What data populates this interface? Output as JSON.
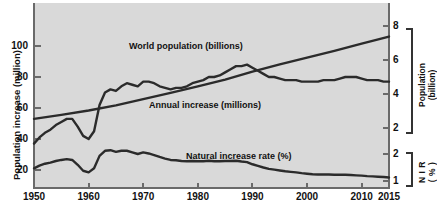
{
  "chart_data": {
    "type": "line",
    "title": "",
    "xlabel": "",
    "ylabel": "Population increase (million)",
    "xlim": [
      1950,
      2015
    ],
    "ylim": [
      0,
      110
    ],
    "grid": false,
    "legend": "inline-annotations",
    "x_ticks": [
      "1950",
      "1960",
      "1970",
      "1980",
      "1990",
      "2000",
      "2010",
      "2015"
    ],
    "x_tick_values": [
      1950,
      1960,
      1970,
      1980,
      1990,
      2000,
      2010,
      2015
    ],
    "y_left_ticks": [
      "20",
      "40",
      "60",
      "80",
      "100"
    ],
    "y_left_tick_values": [
      20,
      40,
      60,
      80,
      100
    ],
    "y_right_upper_label": "Population (billion)",
    "y_right_upper_ticks": [
      "2",
      "4",
      "6",
      "8"
    ],
    "y_right_upper_tick_values": [
      2,
      4,
      6,
      8
    ],
    "y_right_lower_label": "NIR (%)",
    "y_right_lower_ticks": [
      "1",
      "2"
    ],
    "y_right_lower_tick_values": [
      1,
      2
    ],
    "series": [
      {
        "name": "World population (billions)",
        "unit": "billions",
        "axis": "right-upper",
        "x": [
          1950,
          1955,
          1960,
          1965,
          1970,
          1975,
          1980,
          1985,
          1990,
          1995,
          2000,
          2005,
          2010,
          2015
        ],
        "values": [
          2.54,
          2.77,
          3.03,
          3.33,
          3.7,
          4.07,
          4.45,
          4.85,
          5.32,
          5.74,
          6.14,
          6.54,
          6.96,
          7.38
        ]
      },
      {
        "name": "Annual increase (millions)",
        "unit": "millions",
        "axis": "left",
        "x": [
          1950,
          1951,
          1952,
          1953,
          1954,
          1955,
          1956,
          1957,
          1958,
          1959,
          1960,
          1961,
          1962,
          1963,
          1964,
          1965,
          1966,
          1967,
          1968,
          1969,
          1970,
          1971,
          1972,
          1973,
          1974,
          1975,
          1976,
          1977,
          1978,
          1979,
          1980,
          1981,
          1982,
          1983,
          1984,
          1985,
          1986,
          1987,
          1988,
          1989,
          1990,
          1991,
          1992,
          1993,
          1994,
          1995,
          1996,
          1997,
          1998,
          1999,
          2000,
          2001,
          2002,
          2003,
          2004,
          2005,
          2006,
          2007,
          2008,
          2009,
          2010,
          2011,
          2012,
          2013,
          2014,
          2015
        ],
        "values": [
          37,
          41,
          44,
          46,
          49,
          51,
          53,
          53,
          48,
          42,
          40,
          45,
          62,
          70,
          72,
          71,
          74,
          76,
          75,
          74,
          77,
          77,
          76,
          74,
          73,
          72,
          73,
          73,
          74,
          76,
          77,
          78,
          80,
          80,
          81,
          83,
          85,
          87,
          87,
          88,
          86,
          84,
          82,
          80,
          80,
          79,
          78,
          78,
          78,
          77,
          77,
          77,
          77,
          78,
          78,
          78,
          79,
          80,
          80,
          80,
          79,
          78,
          78,
          78,
          77,
          77
        ]
      },
      {
        "name": "Natural increase rate (%)",
        "unit": "%",
        "axis": "right-lower",
        "x": [
          1950,
          1951,
          1952,
          1953,
          1954,
          1955,
          1956,
          1957,
          1958,
          1959,
          1960,
          1961,
          1962,
          1963,
          1964,
          1965,
          1966,
          1967,
          1968,
          1969,
          1970,
          1971,
          1972,
          1973,
          1974,
          1975,
          1976,
          1977,
          1978,
          1979,
          1980,
          1981,
          1982,
          1983,
          1984,
          1985,
          1986,
          1987,
          1988,
          1989,
          1990,
          1991,
          1992,
          1993,
          1994,
          1995,
          1996,
          1997,
          1998,
          1999,
          2000,
          2001,
          2002,
          2003,
          2004,
          2005,
          2006,
          2007,
          2008,
          2009,
          2010,
          2011,
          2012,
          2013,
          2014,
          2015
        ],
        "values": [
          1.47,
          1.57,
          1.64,
          1.68,
          1.74,
          1.78,
          1.81,
          1.78,
          1.6,
          1.38,
          1.32,
          1.47,
          1.93,
          2.12,
          2.14,
          2.08,
          2.12,
          2.12,
          2.06,
          2.0,
          2.06,
          2.02,
          1.96,
          1.89,
          1.83,
          1.78,
          1.77,
          1.74,
          1.73,
          1.74,
          1.73,
          1.73,
          1.75,
          1.73,
          1.73,
          1.74,
          1.74,
          1.75,
          1.72,
          1.7,
          1.62,
          1.56,
          1.5,
          1.45,
          1.42,
          1.39,
          1.36,
          1.34,
          1.32,
          1.29,
          1.27,
          1.25,
          1.24,
          1.24,
          1.24,
          1.23,
          1.23,
          1.23,
          1.22,
          1.21,
          1.2,
          1.18,
          1.17,
          1.16,
          1.15,
          1.13
        ]
      }
    ],
    "annotations": [
      {
        "text": "World population (billions)",
        "x": 1973,
        "y_hint": "upper"
      },
      {
        "text": "Annual increase (millions)",
        "x": 1978,
        "y_hint": "middle"
      },
      {
        "text": "Natural increase rate (%)",
        "x": 1989,
        "y_hint": "lower"
      }
    ],
    "colors": {
      "plot_background": "#d9d9d9",
      "curve": "#2b2b2b",
      "axis": "#6a6a6a",
      "text": "#111111"
    }
  }
}
